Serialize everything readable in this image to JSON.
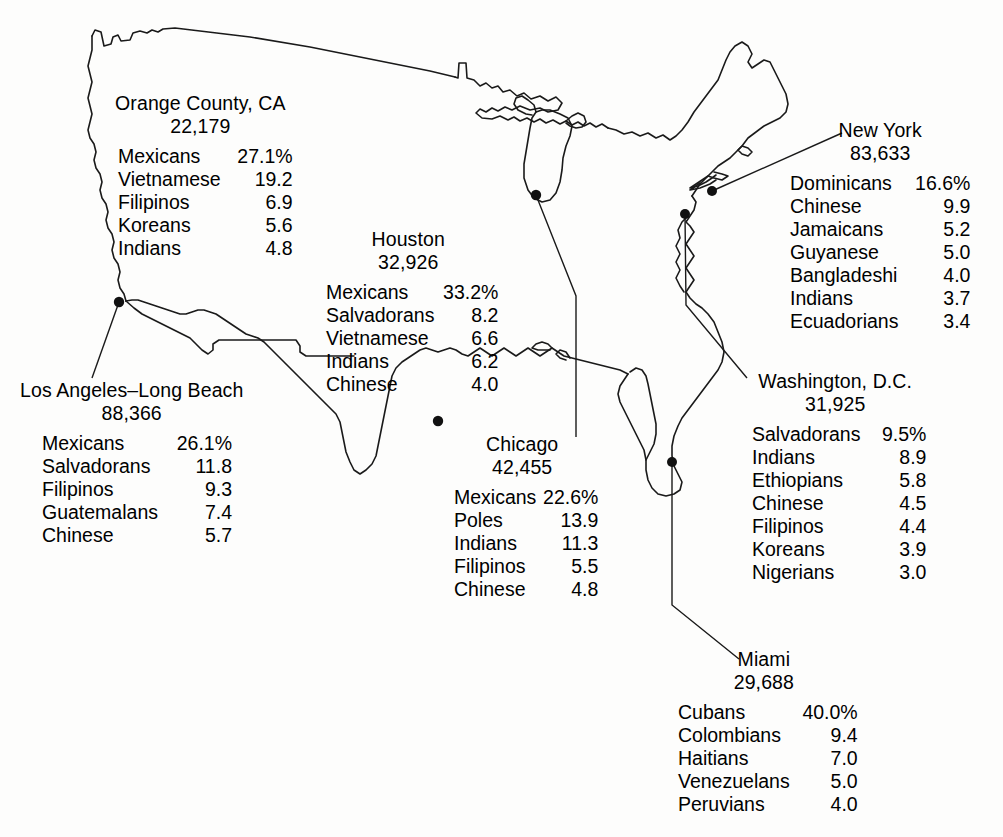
{
  "figure": {
    "type": "map",
    "region": "Contiguous United States",
    "percent_suffix": "%"
  },
  "blocks": [
    {
      "id": "orange-county",
      "city": "Orange County, CA",
      "count": "22,179",
      "groups": [
        {
          "name": "Mexicans",
          "value": "27.1%"
        },
        {
          "name": "Vietnamese",
          "value": "19.2"
        },
        {
          "name": "Filipinos",
          "value": "6.9"
        },
        {
          "name": "Koreans",
          "value": "5.6"
        },
        {
          "name": "Indians",
          "value": "4.8"
        }
      ]
    },
    {
      "id": "los-angeles-long-beach",
      "city": "Los Angeles–Long Beach",
      "count": "88,366",
      "groups": [
        {
          "name": "Mexicans",
          "value": "26.1%"
        },
        {
          "name": "Salvadorans",
          "value": "11.8"
        },
        {
          "name": "Filipinos",
          "value": "9.3"
        },
        {
          "name": "Guatemalans",
          "value": "7.4"
        },
        {
          "name": "Chinese",
          "value": "5.7"
        }
      ]
    },
    {
      "id": "houston",
      "city": "Houston",
      "count": "32,926",
      "groups": [
        {
          "name": "Mexicans",
          "value": "33.2%"
        },
        {
          "name": "Salvadorans",
          "value": "8.2"
        },
        {
          "name": "Vietnamese",
          "value": "6.6"
        },
        {
          "name": "Indians",
          "value": "6.2"
        },
        {
          "name": "Chinese",
          "value": "4.0"
        }
      ]
    },
    {
      "id": "chicago",
      "city": "Chicago",
      "count": "42,455",
      "groups": [
        {
          "name": "Mexicans",
          "value": "22.6%"
        },
        {
          "name": "Poles",
          "value": "13.9"
        },
        {
          "name": "Indians",
          "value": "11.3"
        },
        {
          "name": "Filipinos",
          "value": "5.5"
        },
        {
          "name": "Chinese",
          "value": "4.8"
        }
      ]
    },
    {
      "id": "new-york",
      "city": "New York",
      "count": "83,633",
      "groups": [
        {
          "name": "Dominicans",
          "value": "16.6%"
        },
        {
          "name": "Chinese",
          "value": "9.9"
        },
        {
          "name": "Jamaicans",
          "value": "5.2"
        },
        {
          "name": "Guyanese",
          "value": "5.0"
        },
        {
          "name": "Bangladeshi",
          "value": "4.0"
        },
        {
          "name": "Indians",
          "value": "3.7"
        },
        {
          "name": "Ecuadorians",
          "value": "3.4"
        }
      ]
    },
    {
      "id": "washington-dc",
      "city": "Washington, D.C.",
      "count": "31,925",
      "groups": [
        {
          "name": "Salvadorans",
          "value": "9.5%"
        },
        {
          "name": "Indians",
          "value": "8.9"
        },
        {
          "name": "Ethiopians",
          "value": "5.8"
        },
        {
          "name": "Chinese",
          "value": "4.5"
        },
        {
          "name": "Filipinos",
          "value": "4.4"
        },
        {
          "name": "Koreans",
          "value": "3.9"
        },
        {
          "name": "Nigerians",
          "value": "3.0"
        }
      ]
    },
    {
      "id": "miami",
      "city": "Miami",
      "count": "29,688",
      "groups": [
        {
          "name": "Cubans",
          "value": "40.0%"
        },
        {
          "name": "Colombians",
          "value": "9.4"
        },
        {
          "name": "Haitians",
          "value": "7.0"
        },
        {
          "name": "Venezuelans",
          "value": "5.0"
        },
        {
          "name": "Peruvians",
          "value": "4.0"
        }
      ]
    }
  ],
  "map_markers": [
    {
      "id": "marker-los-angeles",
      "label": "Los Angeles–Long Beach",
      "x": 119,
      "y": 302
    },
    {
      "id": "marker-houston",
      "label": "Houston",
      "x": 438,
      "y": 421
    },
    {
      "id": "marker-chicago",
      "label": "Chicago",
      "x": 536,
      "y": 195
    },
    {
      "id": "marker-new-york",
      "label": "New York",
      "x": 712,
      "y": 191
    },
    {
      "id": "marker-washington",
      "label": "Washington, D.C.",
      "x": 685,
      "y": 214
    },
    {
      "id": "marker-miami",
      "label": "Miami",
      "x": 672,
      "y": 462
    }
  ],
  "style": {
    "outline_color": "#1a1a1a",
    "text_color": "#000000",
    "background_color": "#ffffff"
  }
}
